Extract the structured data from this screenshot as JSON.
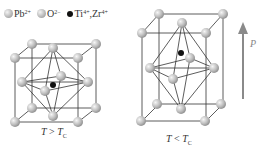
{
  "legend": {
    "pb": {
      "symbol": "Pb",
      "charge": "2+"
    },
    "o": {
      "symbol": "O",
      "charge": "2−"
    },
    "ti_zr": {
      "symbol1": "Ti",
      "charge1": "4+",
      "sep": ", ",
      "symbol2": "Zr",
      "charge2": "4+"
    }
  },
  "cubes": [
    {
      "label_T": "T",
      "relation": " > ",
      "label_Tc": "T",
      "sub": "C",
      "state": "cubic (paraelectric)"
    },
    {
      "label_T": "T",
      "relation": " < ",
      "label_Tc": "T",
      "sub": "C",
      "state": "tetragonal (ferroelectric)"
    }
  ],
  "polarization": {
    "symbol": "P",
    "vector_mark": "→"
  },
  "colors": {
    "line": "#333333",
    "arrow": "#8a8a8a",
    "sphere_light": "#f4f4f4",
    "sphere_dark": "#8a8a8a",
    "ion": "#111111"
  }
}
